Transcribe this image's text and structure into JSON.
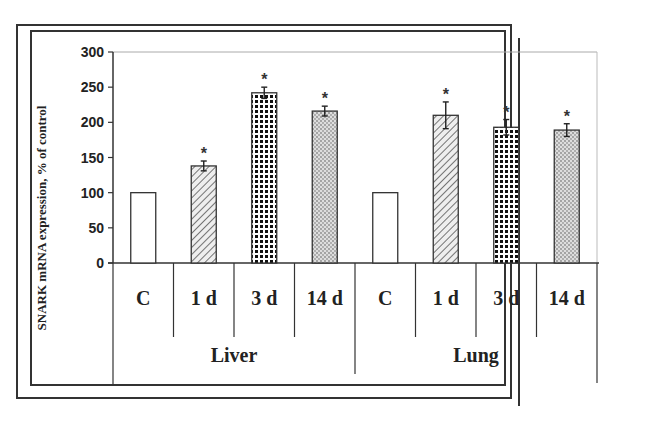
{
  "chart_data": {
    "type": "bar",
    "title": "",
    "xlabel": "",
    "ylabel": "SNARK mRNA expression, % of control",
    "ylim": [
      0,
      300
    ],
    "yticks": [
      0,
      50,
      100,
      150,
      200,
      250,
      300
    ],
    "grid": false,
    "legend": null,
    "groups": [
      {
        "name": "Liver",
        "categories": [
          "C",
          "1 d",
          "3 d",
          "14 d"
        ],
        "values": [
          100,
          138,
          242,
          216
        ],
        "errors": [
          0,
          7,
          8,
          7
        ],
        "significant": [
          false,
          true,
          true,
          true
        ]
      },
      {
        "name": "Lung",
        "categories": [
          "C",
          "1 d",
          "3 d",
          "14 d"
        ],
        "values": [
          100,
          210,
          193,
          189
        ],
        "errors": [
          0,
          19,
          11,
          9
        ],
        "significant": [
          false,
          true,
          true,
          true
        ]
      }
    ],
    "patterns": {
      "C": "white",
      "1 d": "diagonal-hatch",
      "3 d": "dark-checker",
      "14 d": "light-dots"
    },
    "significance_marker": "*"
  }
}
